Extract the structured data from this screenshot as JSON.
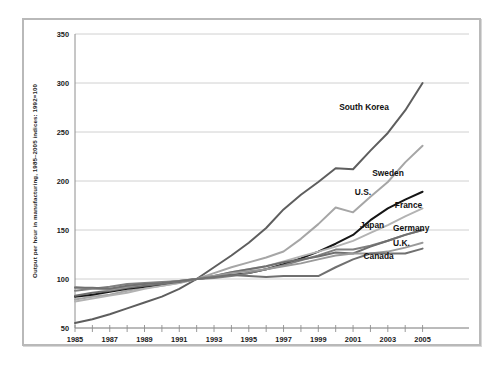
{
  "figure": {
    "frame_color": "#b9b9b9",
    "background": "#ffffff"
  },
  "chart_data": {
    "type": "line",
    "title": "",
    "subtitle": "",
    "xlabel": "",
    "ylabel": "Output per hour in manufacturing, 1985–2005 indices: 1992=100",
    "xlim": [
      1985,
      2005.6
    ],
    "ylim": [
      50,
      350
    ],
    "yticks": [
      50,
      100,
      150,
      200,
      250,
      300,
      350
    ],
    "ytick_labels": [
      "50",
      "100",
      "150",
      "200",
      "250",
      "300",
      "350"
    ],
    "xticks": [
      1985,
      1986,
      1987,
      1988,
      1989,
      1990,
      1991,
      1992,
      1993,
      1994,
      1995,
      1996,
      1997,
      1998,
      1999,
      2000,
      2001,
      2002,
      2003,
      2004,
      2005
    ],
    "xtick_labels_shown": [
      "1985",
      "1987",
      "1989",
      "1991",
      "1993",
      "1995",
      "1997",
      "1999",
      "2001",
      "2003",
      "2005"
    ],
    "grid": true,
    "grid_axis": "y",
    "legend_position": "inline-right-labels",
    "x": [
      1985,
      1986,
      1987,
      1988,
      1989,
      1990,
      1991,
      1992,
      1993,
      1994,
      1995,
      1996,
      1997,
      1998,
      1999,
      2000,
      2001,
      2002,
      2003,
      2004,
      2005
    ],
    "series": [
      {
        "name": "South Korea",
        "color": "#5e5e5e",
        "width": 2.0,
        "label_x": 2000.2,
        "label_y": 272,
        "values": [
          55,
          59,
          64,
          70,
          76,
          82,
          90,
          100,
          112,
          124,
          137,
          152,
          171,
          186,
          199,
          213,
          212,
          231,
          249,
          272,
          300
        ]
      },
      {
        "name": "Sweden",
        "color": "#a6a6a6",
        "width": 2.0,
        "label_x": 2002.1,
        "label_y": 205,
        "values": [
          79,
          82,
          84,
          88,
          91,
          93,
          96,
          100,
          106,
          112,
          117,
          122,
          128,
          141,
          156,
          173,
          168,
          184,
          199,
          219,
          236
        ]
      },
      {
        "name": "U.S.",
        "color": "#161616",
        "width": 2.0,
        "label_x": 2001.1,
        "label_y": 186,
        "values": [
          82,
          84,
          87,
          90,
          92,
          94,
          97,
          100,
          102,
          104,
          106,
          110,
          115,
          121,
          128,
          136,
          145,
          160,
          172,
          181,
          189
        ]
      },
      {
        "name": "France",
        "color": "#b3b3b3",
        "width": 1.9,
        "label_x": 2003.4,
        "label_y": 172,
        "values": [
          77,
          80,
          83,
          86,
          90,
          93,
          96,
          100,
          103,
          107,
          110,
          113,
          118,
          123,
          128,
          133,
          139,
          147,
          155,
          164,
          172
        ]
      },
      {
        "name": "Japan",
        "color": "#808080",
        "width": 2.0,
        "label_x": 2001.4,
        "label_y": 152,
        "values": [
          88,
          90,
          92,
          95,
          96,
          97,
          98,
          100,
          101,
          103,
          106,
          110,
          114,
          119,
          124,
          130,
          130,
          134,
          139,
          145,
          150
        ]
      },
      {
        "name": "Germany",
        "color": "#6f6f6f",
        "width": 2.0,
        "label_x": 2003.3,
        "label_y": 149,
        "values": [
          83,
          86,
          88,
          91,
          93,
          95,
          97,
          100,
          103,
          107,
          110,
          113,
          117,
          120,
          123,
          127,
          126,
          133,
          139,
          145,
          150
        ]
      },
      {
        "name": "U.K.",
        "color": "#9a9a9a",
        "width": 1.9,
        "label_x": 2003.3,
        "label_y": 134,
        "values": [
          92,
          90,
          89,
          92,
          95,
          96,
          98,
          100,
          103,
          106,
          108,
          110,
          113,
          116,
          120,
          124,
          126,
          126,
          128,
          132,
          137
        ]
      },
      {
        "name": "Canada",
        "color": "#707070",
        "width": 2.0,
        "label_x": 2001.6,
        "label_y": 120,
        "values": [
          91,
          91,
          90,
          93,
          95,
          96,
          98,
          100,
          102,
          104,
          103,
          102,
          103,
          103,
          103,
          112,
          120,
          126,
          126,
          126,
          131
        ]
      }
    ]
  }
}
